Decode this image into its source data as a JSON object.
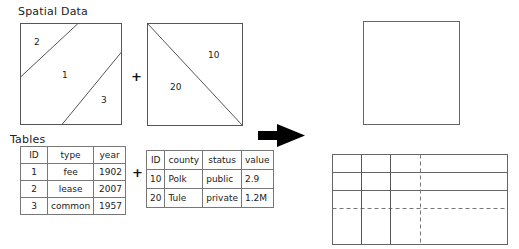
{
  "sections": {
    "spatial_title": "Spatial Data",
    "tables_title": "Tables"
  },
  "spatial": {
    "layer_a": {
      "labels": [
        "2",
        "1",
        "3"
      ]
    },
    "operator": "+",
    "layer_b": {
      "labels": [
        "10",
        "20"
      ]
    }
  },
  "tables": {
    "table_a": {
      "columns": [
        "ID",
        "type",
        "year"
      ],
      "rows": [
        [
          "1",
          "fee",
          "1902"
        ],
        [
          "2",
          "lease",
          "2007"
        ],
        [
          "3",
          "common",
          "1957"
        ]
      ]
    },
    "operator": "+",
    "table_b": {
      "columns": [
        "ID",
        "county",
        "status",
        "value"
      ],
      "rows": [
        [
          "10",
          "Polk",
          "public",
          "2.9"
        ],
        [
          "20",
          "Tule",
          "private",
          "1.2M"
        ]
      ]
    }
  },
  "result": {
    "arrow": "right-arrow",
    "spatial_output": "empty-square",
    "table_output": "empty-grid-4x4"
  },
  "colors": {
    "line": "#555555",
    "arrow": "#000000",
    "background": "#ffffff"
  }
}
